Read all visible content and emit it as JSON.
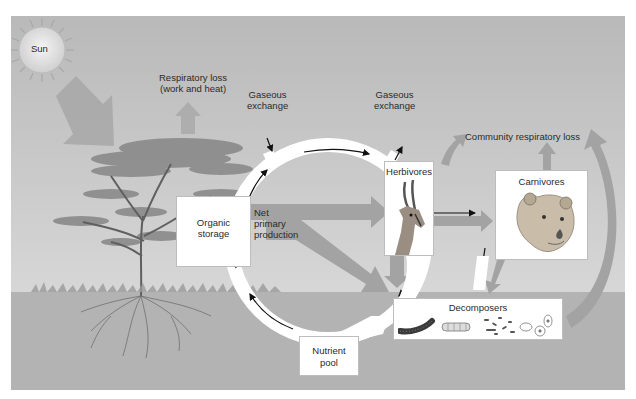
{
  "diagram": {
    "title_visible": false,
    "nodes": {
      "sun": "Sun",
      "organic_storage": [
        "Organic",
        "storage"
      ],
      "herbivores": "Herbivores",
      "carnivores": "Carnivores",
      "decomposers": "Decomposers",
      "nutrient_pool": [
        "Nutrient",
        "pool"
      ]
    },
    "labels": {
      "respiratory_loss": [
        "Respiratory loss",
        "(work and heat)"
      ],
      "gaseous_exchange_in": [
        "Gaseous",
        "exchange"
      ],
      "gaseous_exchange_out": [
        "Gaseous",
        "exchange"
      ],
      "community_respiratory_loss": "Community respiratory loss",
      "net_primary_production": [
        "Net",
        "primary",
        "production"
      ]
    },
    "icons": {
      "sun": "sun-icon",
      "tree": "acacia-tree-icon",
      "herbivore": "gazelle-icon",
      "carnivore": "lioness-icon",
      "decomposers": [
        "millipede-icon",
        "larva-icon",
        "bacteria-icon",
        "fungi-cells-icon"
      ]
    },
    "colors": {
      "sky_top": "#b9b9b9",
      "sky_bottom": "#dcdcdc",
      "ground": "#b3b3b3",
      "flow_arrow": "#a3a3a3",
      "cycle_ring": "#ffffff",
      "text": "#2a2a2a"
    }
  }
}
